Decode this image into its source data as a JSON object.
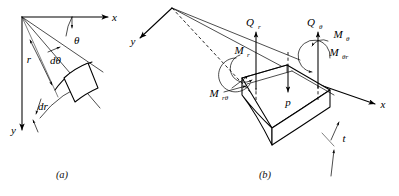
{
  "figure": {
    "background_color": "#ffffff",
    "line_color": "#000000",
    "panels": [
      {
        "id": "a",
        "caption": "(a)",
        "description": "Polar coordinate plate element showing r, theta, dr, d-theta"
      },
      {
        "id": "b",
        "caption": "(b)",
        "description": "Three dimensional plate element with moments and shear resultants"
      }
    ]
  },
  "panel_a": {
    "caption": "(a)",
    "axes": {
      "x_label": "x",
      "y_label": "y"
    },
    "labels": {
      "theta": "θ",
      "d_theta": "dθ",
      "r": "r",
      "dr": "dr"
    }
  },
  "panel_b": {
    "caption": "(b)",
    "axes": {
      "x_label": "x",
      "y_label": "y"
    },
    "resultants": [
      {
        "name": "Q_r",
        "base": "Q",
        "sub": "r",
        "kind": "shear-force",
        "direction": "up"
      },
      {
        "name": "Q_theta",
        "base": "Q",
        "sub": "θ",
        "kind": "shear-force",
        "direction": "up"
      },
      {
        "name": "M_r",
        "base": "M",
        "sub": "r",
        "kind": "bending-moment",
        "direction": "arc"
      },
      {
        "name": "M_theta",
        "base": "M",
        "sub": "θ",
        "kind": "bending-moment",
        "direction": "arc"
      },
      {
        "name": "M_r_theta",
        "base": "M",
        "sub": "rθ",
        "kind": "twisting-moment",
        "direction": "arc"
      },
      {
        "name": "M_theta_r",
        "base": "M",
        "sub": "θr",
        "kind": "twisting-moment",
        "direction": "arc"
      },
      {
        "name": "p",
        "base": "p",
        "sub": "",
        "kind": "pressure-load",
        "direction": "down"
      }
    ],
    "thickness_label": "t"
  }
}
